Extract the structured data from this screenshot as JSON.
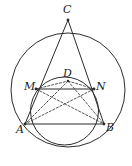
{
  "figure": {
    "background_color": "#ffffff",
    "stroke_color": "#2b2b2b",
    "dashed_stroke_color": "#3a3a3a",
    "width": 132,
    "height": 166,
    "points": [
      {
        "id": "C",
        "label": "C",
        "x": 68,
        "y": 20,
        "label_x": 63,
        "label_y": 4
      },
      {
        "id": "M",
        "label": "M",
        "x": 36,
        "y": 89,
        "label_x": 24,
        "label_y": 81
      },
      {
        "id": "D",
        "label": "D",
        "x": 68,
        "y": 81,
        "label_x": 63,
        "label_y": 68
      },
      {
        "id": "N",
        "label": "N",
        "x": 94,
        "y": 89,
        "label_x": 96,
        "label_y": 81
      },
      {
        "id": "A",
        "label": "A",
        "x": 25,
        "y": 124,
        "label_x": 16,
        "label_y": 124
      },
      {
        "id": "B",
        "label": "B",
        "x": 104,
        "y": 124,
        "label_x": 106,
        "label_y": 122
      }
    ],
    "circles": [
      {
        "id": "circumcircle",
        "name": "large-circle",
        "cx": 68,
        "cy": 90,
        "r": 57,
        "style": "solid"
      },
      {
        "id": "inner-circle",
        "name": "small-circle",
        "cx": 64.5,
        "cy": 111,
        "r": 34,
        "style": "solid"
      }
    ],
    "segments": [
      {
        "id": "CA",
        "from": "C",
        "to": "A",
        "style": "solid"
      },
      {
        "id": "CB",
        "from": "C",
        "to": "B",
        "style": "solid"
      },
      {
        "id": "MN",
        "from": "M",
        "to": "N",
        "style": "solid"
      },
      {
        "id": "AB",
        "from": "A",
        "to": "B",
        "style": "solid"
      },
      {
        "id": "MB",
        "from": "M",
        "to": "B",
        "style": "dashed"
      },
      {
        "id": "NA",
        "from": "N",
        "to": "A",
        "style": "dashed"
      },
      {
        "id": "DA",
        "from": "D",
        "to": "A",
        "style": "dashed"
      },
      {
        "id": "DB",
        "from": "D",
        "to": "B",
        "style": "dashed"
      },
      {
        "id": "MD",
        "from": "M",
        "to": "D",
        "style": "dashed"
      },
      {
        "id": "DN",
        "from": "D",
        "to": "N",
        "style": "dashed"
      }
    ],
    "labels": {
      "C": "C",
      "M": "M",
      "D": "D",
      "N": "N",
      "A": "A",
      "B": "B"
    }
  }
}
